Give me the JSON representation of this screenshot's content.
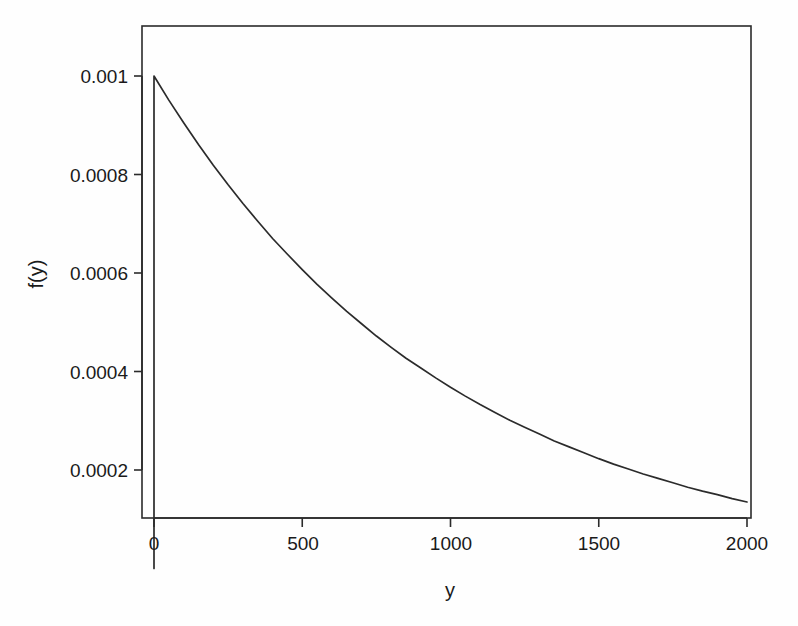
{
  "chart_data": {
    "type": "line",
    "title": "",
    "subtitle": "",
    "xlabel": "y",
    "ylabel": "f(y)",
    "xlim": [
      0,
      2000
    ],
    "ylim": [
      0,
      0.00108
    ],
    "grid": false,
    "legend": null,
    "legend_position": "none",
    "x_ticks": [
      {
        "value": 0,
        "label": "0"
      },
      {
        "value": 500,
        "label": "500"
      },
      {
        "value": 1000,
        "label": "1000"
      },
      {
        "value": 1500,
        "label": "1500"
      },
      {
        "value": 2000,
        "label": "2000"
      }
    ],
    "y_ticks": [
      {
        "value": 0.0002,
        "label": "0.0002"
      },
      {
        "value": 0.0004,
        "label": "0.0004"
      },
      {
        "value": 0.0006,
        "label": "0.0006"
      },
      {
        "value": 0.0008,
        "label": "0.0008"
      },
      {
        "value": 0.001,
        "label": "0.001"
      }
    ],
    "function": "f(y) = 0.001 * exp(-0.001 * y)",
    "rate": 0.001,
    "peak_value": 0.001,
    "series": [
      {
        "name": "f(y)",
        "color": "#2b2b2b",
        "x": [
          0,
          0,
          50,
          100,
          150,
          200,
          250,
          300,
          350,
          400,
          450,
          500,
          550,
          600,
          650,
          700,
          750,
          800,
          850,
          900,
          950,
          1000,
          1050,
          1100,
          1150,
          1200,
          1250,
          1300,
          1350,
          1400,
          1450,
          1500,
          1550,
          1600,
          1650,
          1700,
          1750,
          1800,
          1850,
          1900,
          1950,
          2000
        ],
        "values": [
          0,
          0.001,
          0.000951,
          0.000905,
          0.000861,
          0.000819,
          0.000779,
          0.000741,
          0.000705,
          0.00067,
          0.000638,
          0.000607,
          0.000577,
          0.000549,
          0.000522,
          0.000497,
          0.000472,
          0.000449,
          0.000427,
          0.000407,
          0.000387,
          0.000368,
          0.00035,
          0.000333,
          0.000317,
          0.000301,
          0.000287,
          0.000273,
          0.000259,
          0.000247,
          0.000235,
          0.000223,
          0.000212,
          0.000202,
          0.000192,
          0.000183,
          0.000174,
          0.000165,
          0.000157,
          0.00015,
          0.000142,
          0.000135
        ]
      }
    ]
  },
  "style": {
    "line_color": "#2b2b2b",
    "box_color": "#2b2b2b",
    "axis_color": "#2b2b2b",
    "background": "#fefefe"
  }
}
